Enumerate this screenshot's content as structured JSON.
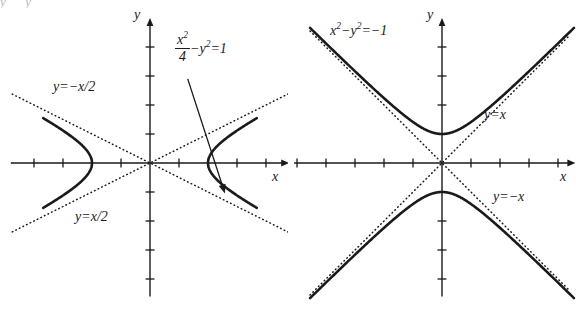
{
  "figure": {
    "background": "#ffffff",
    "stroke_color": "#1a1a1a",
    "width": 576,
    "height": 310
  },
  "panels": [
    {
      "id": "left",
      "axis_x_label": "x",
      "axis_y_label": "y",
      "equation_label": {
        "numerator": "x",
        "numerator_exp": "2",
        "denominator": "4",
        "rest": "−y",
        "rest_exp": "2",
        "tail": "=1"
      },
      "asymptote_upper_label": "y=−x/2",
      "asymptote_lower_label": "y=x/2",
      "origin": {
        "x": 150,
        "y": 163
      },
      "unit_px": 29,
      "x_axis_range": [
        -4.8,
        4.8
      ],
      "y_axis_range": [
        -4.6,
        5.0
      ],
      "x_ticks": [
        -4,
        -3,
        -2,
        -1,
        1,
        2,
        3,
        4
      ],
      "y_ticks": [
        -4,
        -3,
        -2,
        -1,
        1,
        2,
        3,
        4
      ]
    },
    {
      "id": "right",
      "axis_x_label": "x",
      "axis_y_label": "y",
      "equation_label": {
        "lead": "x",
        "lead_exp": "2",
        "mid": "−y",
        "mid_exp": "2",
        "tail": "=−1"
      },
      "asymptote_upper_label": "y=x",
      "asymptote_lower_label": "y=−x",
      "origin": {
        "x": 154,
        "y": 163
      },
      "unit_px": 29,
      "x_axis_range": [
        -5.1,
        4.6
      ],
      "y_axis_range": [
        -4.6,
        5.0
      ],
      "x_ticks": [
        -5,
        -4,
        -3,
        -2,
        -1,
        1,
        2,
        3,
        4
      ],
      "y_ticks": [
        -4,
        -3,
        -2,
        -1,
        1,
        2,
        3,
        4
      ]
    }
  ],
  "chart_data": [
    {
      "type": "line",
      "title": "",
      "subtitle": "",
      "xlabel": "x",
      "ylabel": "y",
      "xlim": [
        -4.8,
        4.8
      ],
      "ylim": [
        -4.6,
        5.0
      ],
      "grid": false,
      "legend": "none",
      "curve_equation": "x^2/4 - y^2 = 1",
      "curve_equation_display": "x²/4 − y² = 1",
      "a": 2,
      "b": 1,
      "orientation": "horizontal",
      "vertices": [
        [
          -2,
          0
        ],
        [
          2,
          0
        ]
      ],
      "asymptotes": [
        {
          "label": "y=−x/2",
          "slope": -0.5,
          "intercept": 0,
          "style": "dotted"
        },
        {
          "label": "y=x/2",
          "slope": 0.5,
          "intercept": 0,
          "style": "dotted"
        }
      ],
      "annotation": {
        "text": "x²/4 − y² = 1",
        "arrow_from": [
          1.3,
          2.9
        ],
        "arrow_to": [
          2.6,
          -1.1
        ]
      },
      "series": [
        {
          "name": "right branch",
          "points": [
            [
              2,
              0
            ],
            [
              2.06,
              0.25
            ],
            [
              2.24,
              0.51
            ],
            [
              2.5,
              0.75
            ],
            [
              2.83,
              1.0
            ],
            [
              3.2,
              1.25
            ],
            [
              3.61,
              1.5
            ],
            [
              4.03,
              1.75
            ],
            [
              4.47,
              2.0
            ],
            [
              4.7,
              2.12
            ]
          ]
        },
        {
          "name": "right branch (lower)",
          "points": [
            [
              2,
              0
            ],
            [
              2.06,
              -0.25
            ],
            [
              2.24,
              -0.51
            ],
            [
              2.5,
              -0.75
            ],
            [
              2.83,
              -1.0
            ],
            [
              3.2,
              -1.25
            ],
            [
              3.61,
              -1.5
            ],
            [
              4.03,
              -1.75
            ],
            [
              4.47,
              -2.0
            ],
            [
              4.7,
              -2.12
            ]
          ]
        },
        {
          "name": "left branch",
          "points": [
            [
              -2,
              0
            ],
            [
              -2.06,
              0.25
            ],
            [
              -2.24,
              0.51
            ],
            [
              -2.5,
              0.75
            ],
            [
              -2.83,
              1.0
            ],
            [
              -3.2,
              1.25
            ],
            [
              -3.61,
              1.5
            ],
            [
              -4.03,
              1.75
            ],
            [
              -4.47,
              2.0
            ],
            [
              -4.7,
              2.12
            ]
          ]
        },
        {
          "name": "left branch (lower)",
          "points": [
            [
              -2,
              0
            ],
            [
              -2.06,
              -0.25
            ],
            [
              -2.24,
              -0.51
            ],
            [
              -2.5,
              -0.75
            ],
            [
              -2.83,
              -1.0
            ],
            [
              -3.2,
              -1.25
            ],
            [
              -3.61,
              -1.5
            ],
            [
              -4.03,
              -1.75
            ],
            [
              -4.47,
              -2.0
            ],
            [
              -4.7,
              -2.12
            ]
          ]
        }
      ]
    },
    {
      "type": "line",
      "title": "",
      "subtitle": "",
      "xlabel": "x",
      "ylabel": "y",
      "xlim": [
        -5.1,
        4.6
      ],
      "ylim": [
        -4.6,
        5.0
      ],
      "grid": false,
      "legend": "none",
      "curve_equation": "x^2 - y^2 = -1",
      "curve_equation_display": "x² − y² = −1",
      "a": 1,
      "b": 1,
      "orientation": "vertical",
      "vertices": [
        [
          0,
          -1
        ],
        [
          0,
          1
        ]
      ],
      "asymptotes": [
        {
          "label": "y=x",
          "slope": 1,
          "intercept": 0,
          "style": "dotted"
        },
        {
          "label": "y=−x",
          "slope": -1,
          "intercept": 0,
          "style": "dotted"
        }
      ],
      "annotation": {
        "text": "x² − y² = −1",
        "arrow_from": null,
        "arrow_to": null
      },
      "series": [
        {
          "name": "upper branch",
          "points": [
            [
              -4.4,
              4.51
            ],
            [
              -3.8,
              3.93
            ],
            [
              -3.2,
              3.35
            ],
            [
              -2.6,
              2.79
            ],
            [
              -2.0,
              2.24
            ],
            [
              -1.5,
              1.8
            ],
            [
              -1.0,
              1.41
            ],
            [
              -0.6,
              1.17
            ],
            [
              -0.3,
              1.044
            ],
            [
              0,
              1
            ],
            [
              0.3,
              1.044
            ],
            [
              0.6,
              1.17
            ],
            [
              1.0,
              1.41
            ],
            [
              1.5,
              1.8
            ],
            [
              2.0,
              2.24
            ],
            [
              2.6,
              2.79
            ],
            [
              3.2,
              3.35
            ],
            [
              3.8,
              3.93
            ],
            [
              4.2,
              4.32
            ]
          ]
        },
        {
          "name": "lower branch",
          "points": [
            [
              -4.4,
              -4.51
            ],
            [
              -3.8,
              -3.93
            ],
            [
              -3.2,
              -3.35
            ],
            [
              -2.6,
              -2.79
            ],
            [
              -2.0,
              -2.24
            ],
            [
              -1.5,
              -1.8
            ],
            [
              -1.0,
              -1.41
            ],
            [
              -0.6,
              -1.17
            ],
            [
              -0.3,
              -1.044
            ],
            [
              0,
              -1
            ],
            [
              0.3,
              -1.044
            ],
            [
              0.6,
              -1.17
            ],
            [
              1.0,
              -1.41
            ],
            [
              1.5,
              -1.8
            ],
            [
              2.0,
              -2.24
            ],
            [
              2.6,
              -2.79
            ],
            [
              3.2,
              -3.35
            ],
            [
              3.8,
              -3.93
            ],
            [
              4.2,
              -4.32
            ]
          ]
        }
      ]
    }
  ]
}
